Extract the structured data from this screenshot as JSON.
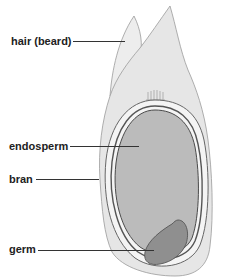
{
  "figure": {
    "labels": {
      "hair": "hair (beard)",
      "endosperm": "endosperm",
      "bran": "bran",
      "germ": "germ"
    }
  },
  "colors": {
    "husk_fill": "#e6e6e6",
    "husk_stroke": "#9a9a9a",
    "bran_fill": "#f2f2f2",
    "bran_stroke": "#555555",
    "endosperm_fill": "#b9b9b9",
    "germ_fill": "#8e8e8e",
    "label_text": "#222222",
    "leader_line": "#333333"
  }
}
